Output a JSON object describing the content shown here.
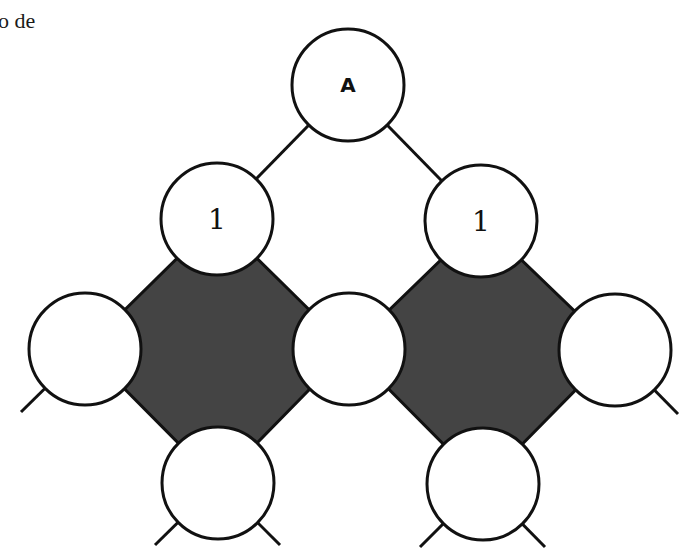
{
  "caption": "o de",
  "colors": {
    "fill_dark": "#444444",
    "stroke": "#111111",
    "node_fill": "#ffffff"
  },
  "nodes": [
    {
      "id": "root",
      "label": "A",
      "cx": 348,
      "cy": 85
    },
    {
      "id": "left-1",
      "label": "1",
      "cx": 217,
      "cy": 219
    },
    {
      "id": "right-1",
      "label": "1",
      "cx": 481,
      "cy": 221
    },
    {
      "id": "mid-left",
      "label": "",
      "cx": 85,
      "cy": 349
    },
    {
      "id": "mid-center",
      "label": "",
      "cx": 349,
      "cy": 349
    },
    {
      "id": "mid-right",
      "label": "",
      "cx": 615,
      "cy": 350
    },
    {
      "id": "bottom-left",
      "label": "",
      "cx": 218,
      "cy": 483
    },
    {
      "id": "bottom-right",
      "label": "",
      "cx": 483,
      "cy": 484
    }
  ]
}
